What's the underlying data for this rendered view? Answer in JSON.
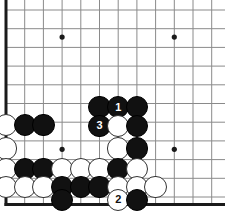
{
  "diagram": {
    "kind": "go-board-diagram",
    "board_size": 19,
    "visible_corner": "bottom-left",
    "background_color": "#ffffff",
    "line_color": "#8a8a8a",
    "edge_color": "#1a1a1a",
    "black_color": "#111111",
    "white_color": "#ffffff",
    "grid": {
      "origin_x": 6,
      "origin_y": 10,
      "spacing": 18.7,
      "columns_visible": 12,
      "rows_visible": 11,
      "edge_left": true,
      "edge_bottom": true,
      "edge_top": false,
      "edge_right": false,
      "grid_on": true
    },
    "star_points": [
      {
        "col": 3,
        "row": 1.45
      },
      {
        "col": 9,
        "row": 1.45
      },
      {
        "col": 3,
        "row": 7.45
      },
      {
        "col": 9,
        "row": 7.45
      }
    ],
    "move_sequence": [
      {
        "number": "1",
        "color": "black",
        "col": 6,
        "row": 5.2
      },
      {
        "number": "2",
        "color": "white",
        "col": 6,
        "row": 10.15
      },
      {
        "number": "3",
        "color": "black",
        "col": 5,
        "row": 6.2
      }
    ],
    "stones": [
      {
        "id": "b-c5-r5",
        "color": "black",
        "col": 5,
        "row": 5.2,
        "label": ""
      },
      {
        "id": "b-c6-r5",
        "color": "black",
        "col": 6,
        "row": 5.2,
        "label": "1"
      },
      {
        "id": "b-c7-r5",
        "color": "black",
        "col": 7,
        "row": 5.2,
        "label": ""
      },
      {
        "id": "b-c5-r6",
        "color": "black",
        "col": 5,
        "row": 6.2,
        "label": "3"
      },
      {
        "id": "w-c6-r6",
        "color": "white",
        "col": 6,
        "row": 6.2,
        "label": ""
      },
      {
        "id": "b-c7-r6",
        "color": "black",
        "col": 7,
        "row": 6.2,
        "label": ""
      },
      {
        "id": "w-c0-r6",
        "color": "white",
        "col": 0,
        "row": 6.15,
        "label": ""
      },
      {
        "id": "b-c1-r6",
        "color": "black",
        "col": 1,
        "row": 6.15,
        "label": ""
      },
      {
        "id": "b-c2-r6",
        "color": "black",
        "col": 2,
        "row": 6.15,
        "label": ""
      },
      {
        "id": "w-c0-r7",
        "color": "white",
        "col": 0,
        "row": 7.4,
        "label": ""
      },
      {
        "id": "w-c6-r7",
        "color": "white",
        "col": 6,
        "row": 7.4,
        "label": ""
      },
      {
        "id": "b-c7-r7",
        "color": "black",
        "col": 7,
        "row": 7.4,
        "label": ""
      },
      {
        "id": "w-c0-r8",
        "color": "white",
        "col": 0,
        "row": 8.5,
        "label": ""
      },
      {
        "id": "b-c1-r8",
        "color": "black",
        "col": 1,
        "row": 8.5,
        "label": ""
      },
      {
        "id": "b-c2-r8",
        "color": "black",
        "col": 2,
        "row": 8.5,
        "label": ""
      },
      {
        "id": "w-c3-r8",
        "color": "white",
        "col": 3,
        "row": 8.5,
        "label": ""
      },
      {
        "id": "w-c4-r8",
        "color": "white",
        "col": 4,
        "row": 8.5,
        "label": ""
      },
      {
        "id": "w-c5-r8",
        "color": "white",
        "col": 5,
        "row": 8.5,
        "label": ""
      },
      {
        "id": "b-c6-r8",
        "color": "black",
        "col": 6,
        "row": 8.5,
        "label": ""
      },
      {
        "id": "w-c7-r8",
        "color": "white",
        "col": 7,
        "row": 8.5,
        "label": ""
      },
      {
        "id": "w-c0-r9",
        "color": "white",
        "col": 0,
        "row": 9.45,
        "label": ""
      },
      {
        "id": "w-c1-r9",
        "color": "white",
        "col": 1,
        "row": 9.45,
        "label": ""
      },
      {
        "id": "w-c2-r9",
        "color": "white",
        "col": 2,
        "row": 9.45,
        "label": ""
      },
      {
        "id": "b-c3-r9",
        "color": "black",
        "col": 3,
        "row": 9.45,
        "label": ""
      },
      {
        "id": "b-c4-r9",
        "color": "black",
        "col": 4,
        "row": 9.45,
        "label": ""
      },
      {
        "id": "b-c5-r9",
        "color": "black",
        "col": 5,
        "row": 9.45,
        "label": ""
      },
      {
        "id": "w-c6-r9",
        "color": "white",
        "col": 6,
        "row": 9.45,
        "label": ""
      },
      {
        "id": "w-c7-r9",
        "color": "white",
        "col": 7,
        "row": 9.45,
        "label": ""
      },
      {
        "id": "w-c8-r9",
        "color": "white",
        "col": 8,
        "row": 9.45,
        "label": ""
      },
      {
        "id": "b-c3-r10",
        "color": "black",
        "col": 3,
        "row": 10.15,
        "label": ""
      },
      {
        "id": "w-c6-r10",
        "color": "white",
        "col": 6,
        "row": 10.15,
        "label": "2"
      },
      {
        "id": "b-c7-r10",
        "color": "black",
        "col": 7,
        "row": 10.15,
        "label": ""
      }
    ],
    "stone_radius": 11.2
  }
}
